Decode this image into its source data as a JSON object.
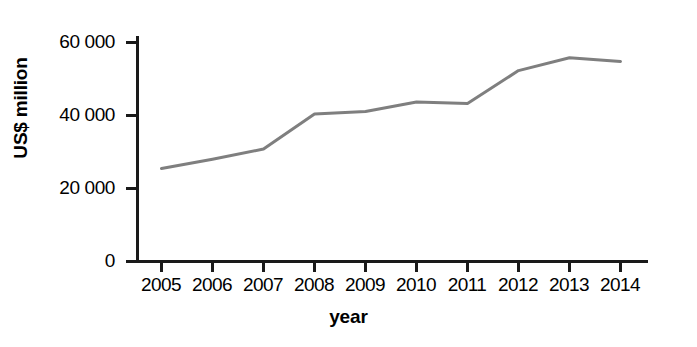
{
  "chart_data": {
    "type": "line",
    "title": "",
    "xlabel": "year",
    "ylabel": "US$ million",
    "categories": [
      "2005",
      "2006",
      "2007",
      "2008",
      "2009",
      "2010",
      "2011",
      "2012",
      "2013",
      "2014"
    ],
    "x": [
      2005,
      2006,
      2007,
      2008,
      2009,
      2010,
      2011,
      2012,
      2013,
      2014
    ],
    "values": [
      25500,
      28000,
      30800,
      40400,
      41100,
      43700,
      43300,
      52300,
      55800,
      54800
    ],
    "series": [
      {
        "name": "US$ million",
        "values": [
          25500,
          28000,
          30800,
          40400,
          41100,
          43700,
          43300,
          52300,
          55800,
          54800
        ],
        "color": "#7f7f7f"
      }
    ],
    "ylim": [
      0,
      62000
    ],
    "yticks": [
      0,
      20000,
      40000,
      60000
    ],
    "ytick_labels": [
      "0",
      "20 000",
      "40 000",
      "60 000"
    ],
    "xtick_labels": [
      "2005",
      "2006",
      "2007",
      "2008",
      "2009",
      "2010",
      "2011",
      "2012",
      "2013",
      "2014"
    ],
    "grid": false,
    "legend": false,
    "legend_position": "none",
    "axis_color": "#1a1a1a",
    "line_color": "#7f7f7f",
    "background_color": "#ffffff"
  },
  "axis": {
    "y_title": "US$ million",
    "x_title": "year"
  },
  "y_ticks": [
    {
      "label": "60 000",
      "value": 60000
    },
    {
      "label": "40 000",
      "value": 40000
    },
    {
      "label": "20 000",
      "value": 20000
    },
    {
      "label": "0",
      "value": 0
    }
  ],
  "x_ticks": [
    {
      "label": "2005"
    },
    {
      "label": "2006"
    },
    {
      "label": "2007"
    },
    {
      "label": "2008"
    },
    {
      "label": "2009"
    },
    {
      "label": "2010"
    },
    {
      "label": "2011"
    },
    {
      "label": "2012"
    },
    {
      "label": "2013"
    },
    {
      "label": "2014"
    }
  ]
}
